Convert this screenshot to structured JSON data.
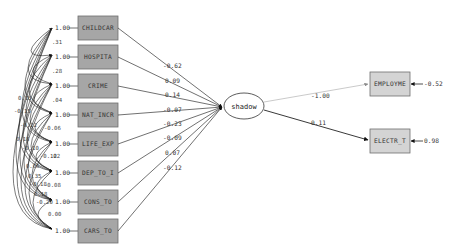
{
  "diagram": {
    "type": "path-diagram",
    "latent": {
      "label": "shadow"
    },
    "causes": [
      {
        "label": "CHILDCAR",
        "variance": "1.00",
        "path": "-0.62"
      },
      {
        "label": "HOSPITA",
        "variance": "1.00",
        "path": "0.09"
      },
      {
        "label": "CRIME",
        "variance": "1.00",
        "path": "0.14"
      },
      {
        "label": "NAT_INCR",
        "variance": "1.00",
        "path": "-0.07"
      },
      {
        "label": "LIFE_EXP",
        "variance": "1.00",
        "path": "-0.23"
      },
      {
        "label": "DEP_TO_I",
        "variance": "1.00",
        "path": "-0.09"
      },
      {
        "label": "CONS_TO",
        "variance": "1.00",
        "path": "0.07"
      },
      {
        "label": "CARS_TO",
        "variance": "1.00",
        "path": "-0.12"
      }
    ],
    "indicators": [
      {
        "label": "EMPLOYME",
        "path": "-1.00",
        "error": "-0.52"
      },
      {
        "label": "ELECTR_T",
        "path": "0.11",
        "error": "0.98"
      }
    ],
    "covariance_labels": [
      ".31",
      ".28",
      ".04",
      "-0.06",
      ".02",
      "-0.12",
      "-0.08",
      "0.00",
      "0.13",
      "-0.15",
      "-0.22",
      "0.18",
      "-0.10",
      "0.06",
      "0.35",
      "0.18",
      "-0.18",
      "-0.20"
    ],
    "colors": {
      "observed_box_fill": "#a6a6a6",
      "indicator_box_fill": "#d4d4d4",
      "box_border": "#6e6e6e",
      "line": "#333333",
      "employme_path_line": "#bdbdbd"
    }
  }
}
